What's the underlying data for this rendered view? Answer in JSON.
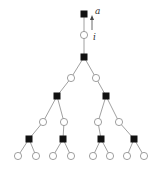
{
  "labels": {
    "top": "a",
    "edge": "i"
  },
  "colors": {
    "square": "#111111",
    "circle_fill": "#ffffff",
    "stroke": "#888888"
  },
  "nodes": [
    {
      "id": "root",
      "shape": "square",
      "x": 84,
      "y": 14
    },
    {
      "id": "c0",
      "shape": "circle",
      "x": 84,
      "y": 35
    },
    {
      "id": "s1",
      "shape": "square",
      "x": 84,
      "y": 57
    },
    {
      "id": "c1a",
      "shape": "circle",
      "x": 71,
      "y": 78
    },
    {
      "id": "c1b",
      "shape": "circle",
      "x": 96,
      "y": 78
    },
    {
      "id": "s2a",
      "shape": "square",
      "x": 57,
      "y": 96
    },
    {
      "id": "s2b",
      "shape": "square",
      "x": 106,
      "y": 96
    },
    {
      "id": "c3a",
      "shape": "circle",
      "x": 43,
      "y": 122
    },
    {
      "id": "c3b",
      "shape": "circle",
      "x": 64,
      "y": 122
    },
    {
      "id": "c3c",
      "shape": "circle",
      "x": 98,
      "y": 122
    },
    {
      "id": "c3d",
      "shape": "circle",
      "x": 119,
      "y": 122
    },
    {
      "id": "s4a",
      "shape": "square",
      "x": 29,
      "y": 139
    },
    {
      "id": "s4b",
      "shape": "square",
      "x": 63,
      "y": 139
    },
    {
      "id": "s4c",
      "shape": "square",
      "x": 101,
      "y": 139
    },
    {
      "id": "s4d",
      "shape": "square",
      "x": 134,
      "y": 139
    },
    {
      "id": "l1",
      "shape": "circle",
      "x": 18,
      "y": 156
    },
    {
      "id": "l2",
      "shape": "circle",
      "x": 36,
      "y": 156
    },
    {
      "id": "l3",
      "shape": "circle",
      "x": 53,
      "y": 156
    },
    {
      "id": "l4",
      "shape": "circle",
      "x": 71,
      "y": 156
    },
    {
      "id": "l5",
      "shape": "circle",
      "x": 93,
      "y": 156
    },
    {
      "id": "l6",
      "shape": "circle",
      "x": 110,
      "y": 156
    },
    {
      "id": "l7",
      "shape": "circle",
      "x": 127,
      "y": 156
    },
    {
      "id": "l8",
      "shape": "circle",
      "x": 144,
      "y": 156
    }
  ],
  "edges": [
    [
      "root",
      "c0"
    ],
    [
      "c0",
      "s1"
    ],
    [
      "s1",
      "c1a"
    ],
    [
      "s1",
      "c1b"
    ],
    [
      "c1a",
      "s2a"
    ],
    [
      "c1b",
      "s2b"
    ],
    [
      "s2a",
      "c3a"
    ],
    [
      "s2a",
      "c3b"
    ],
    [
      "s2b",
      "c3c"
    ],
    [
      "s2b",
      "c3d"
    ],
    [
      "c3a",
      "s4a"
    ],
    [
      "c3b",
      "s4b"
    ],
    [
      "c3c",
      "s4c"
    ],
    [
      "c3d",
      "s4d"
    ],
    [
      "s4a",
      "l1"
    ],
    [
      "s4a",
      "l2"
    ],
    [
      "s4b",
      "l3"
    ],
    [
      "s4b",
      "l4"
    ],
    [
      "s4c",
      "l5"
    ],
    [
      "s4c",
      "l6"
    ],
    [
      "s4d",
      "l7"
    ],
    [
      "s4d",
      "l8"
    ]
  ]
}
